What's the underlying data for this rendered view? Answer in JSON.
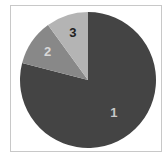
{
  "chart_data": {
    "type": "pie",
    "title": "",
    "categories": [
      "1",
      "2",
      "3"
    ],
    "values": [
      79,
      11,
      10
    ],
    "colors": [
      "#444444",
      "#888888",
      "#b4b4b4"
    ],
    "label_colors": [
      "#c8c8c8",
      "#d8d8d8",
      "#222222"
    ],
    "start_angle_deg": 0,
    "direction": "clockwise",
    "legend": "none",
    "labels_inside": true
  }
}
